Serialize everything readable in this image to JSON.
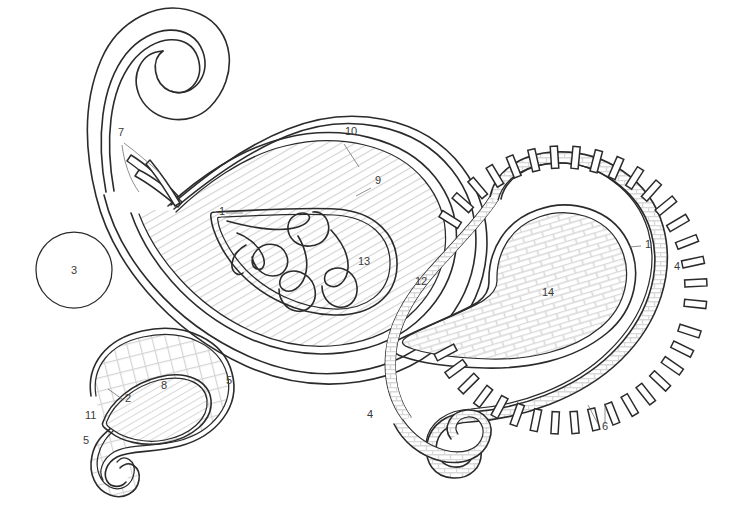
{
  "figure": {
    "background_color": "#ffffff",
    "stroke_color": "#2b2b2b",
    "label_color": "#3a3a3a",
    "hatch_color": "#cfcfcf",
    "canvas": {
      "width": 743,
      "height": 524
    }
  },
  "reference_labels": [
    {
      "id": "label-7",
      "text": "7",
      "x": 118,
      "y": 136,
      "note": "points to stem spikes at left of large paisley"
    },
    {
      "id": "label-10",
      "text": "10",
      "x": 345,
      "y": 135,
      "note": "outer contour of large paisley"
    },
    {
      "id": "label-9",
      "text": "9",
      "x": 375,
      "y": 184,
      "note": "second contour of large paisley"
    },
    {
      "id": "label-1a",
      "text": "1",
      "x": 219,
      "y": 215,
      "note": "inner teardrop boundary, large paisley"
    },
    {
      "id": "label-13",
      "text": "13",
      "x": 358,
      "y": 265,
      "note": "flame motif inside large paisley"
    },
    {
      "id": "label-12",
      "text": "12",
      "x": 415,
      "y": 285,
      "note": "diagonally hatched field of large paisley"
    },
    {
      "id": "label-3",
      "text": "3",
      "x": 71,
      "y": 274,
      "note": "plain circle at left"
    },
    {
      "id": "label-1b",
      "text": "1",
      "x": 645,
      "y": 248,
      "note": "inner teardrop boundary, right paisley"
    },
    {
      "id": "label-4a",
      "text": "4",
      "x": 674,
      "y": 270,
      "note": "brick band of right paisley"
    },
    {
      "id": "label-14",
      "text": "14",
      "x": 542,
      "y": 296,
      "note": "brick hatched field of right paisley"
    },
    {
      "id": "label-4b",
      "text": "4",
      "x": 367,
      "y": 418,
      "note": "brick band, lower left of right paisley"
    },
    {
      "id": "label-6",
      "text": "6",
      "x": 602,
      "y": 430,
      "note": "radial tick marks"
    },
    {
      "id": "label-5a",
      "text": "5",
      "x": 226,
      "y": 384,
      "note": "outer contour of small paisley"
    },
    {
      "id": "label-8",
      "text": "8",
      "x": 161,
      "y": 389,
      "note": "inner teardrop of small paisley"
    },
    {
      "id": "label-2",
      "text": "2",
      "x": 125,
      "y": 402,
      "note": "inner teardrop boundary, small paisley"
    },
    {
      "id": "label-11",
      "text": "11",
      "x": 85,
      "y": 419,
      "note": "cross-hatch field of small paisley"
    },
    {
      "id": "label-5b",
      "text": "5",
      "x": 83,
      "y": 444,
      "note": "outer contour, lower tail of small paisley"
    }
  ],
  "shapes": [
    {
      "name": "large-paisley",
      "fields": [
        "12",
        "13"
      ],
      "hatch": "diagonal",
      "labels": [
        "7",
        "9",
        "10",
        "1",
        "12",
        "13"
      ]
    },
    {
      "name": "right-paisley",
      "fields": [
        "14"
      ],
      "hatch": "brick",
      "labels": [
        "1",
        "4",
        "6",
        "14"
      ]
    },
    {
      "name": "small-paisley",
      "fields": [
        "11",
        "8"
      ],
      "hatch": "cross-hatch + diagonal",
      "labels": [
        "2",
        "5",
        "8",
        "11"
      ]
    },
    {
      "name": "plain-circle",
      "fields": [
        "3"
      ],
      "hatch": "none",
      "labels": [
        "3"
      ]
    }
  ],
  "tick_marks": {
    "count_upper": 18,
    "count_lower": 17,
    "description": "radial rectangular ticks around outer edge of right paisley"
  }
}
